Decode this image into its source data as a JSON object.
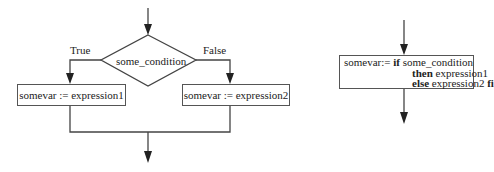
{
  "flowchart": {
    "condition": "some_condition",
    "true_label": "True",
    "false_label": "False",
    "true_branch": "somevar := expression1",
    "false_branch": "somevar := expression2"
  },
  "expression_form": {
    "line1_prefix": "somevar:= ",
    "line1_keyword": "if",
    "line1_rest": " some_condition",
    "line2_keyword": "then",
    "line2_rest": " expression1",
    "line3_keyword": "else",
    "line3_rest": " expression2 ",
    "line3_end_keyword": "fi"
  },
  "colors": {
    "line": "#444444",
    "text": "#222222",
    "background": "#ffffff"
  }
}
